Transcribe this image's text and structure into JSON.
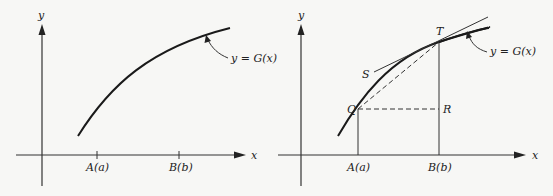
{
  "left_panel": {
    "y_axis_label": "y",
    "x_axis_label": "x",
    "tick_a_label": "A(a)",
    "tick_b_label": "B(b)",
    "curve_label": "y = G(x)"
  },
  "right_panel": {
    "y_axis_label": "y",
    "x_axis_label": "x",
    "tick_a_label": "A(a)",
    "tick_b_label": "B(b)",
    "curve_label": "y = G(x)",
    "point_q": "Q",
    "point_t": "T",
    "point_r": "R",
    "point_s": "S"
  }
}
